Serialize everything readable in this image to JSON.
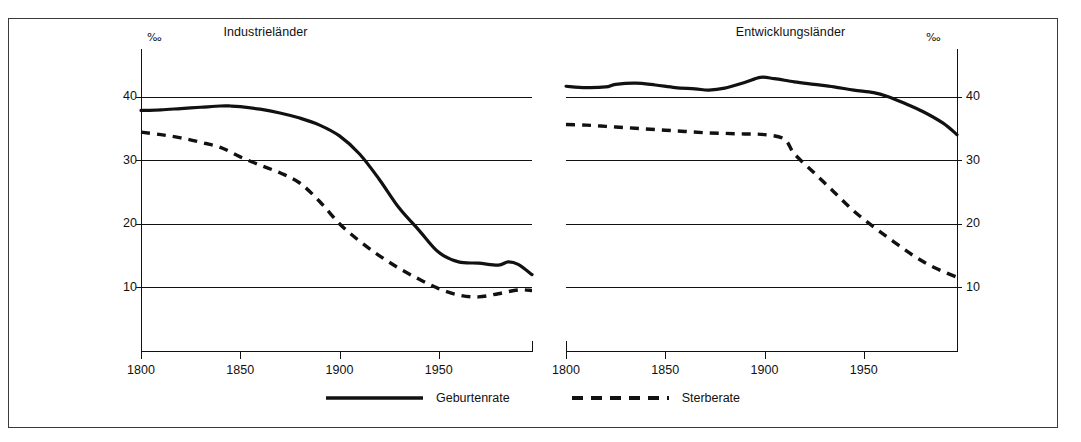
{
  "chart_data": [
    {
      "type": "line",
      "title": "Industrieländer",
      "xlabel": "",
      "ylabel": "‰",
      "xlim": [
        1800,
        1997
      ],
      "ylim": [
        0,
        44
      ],
      "xticks": [
        1800,
        1850,
        1900,
        1950
      ],
      "yticks": [
        10,
        20,
        30,
        40
      ],
      "grid": true,
      "legend_position": "bottom-center",
      "series": [
        {
          "name": "Geburtenrate",
          "style": "solid",
          "x": [
            1800,
            1810,
            1820,
            1830,
            1840,
            1845,
            1850,
            1860,
            1870,
            1880,
            1890,
            1900,
            1910,
            1920,
            1930,
            1940,
            1950,
            1960,
            1970,
            1980,
            1985,
            1990,
            1997
          ],
          "values": [
            37.8,
            37.9,
            38.1,
            38.3,
            38.5,
            38.5,
            38.4,
            38.0,
            37.4,
            36.6,
            35.5,
            33.8,
            31.0,
            27.0,
            22.5,
            19.0,
            15.5,
            14.0,
            13.8,
            13.5,
            14.0,
            13.6,
            12.0
          ]
        },
        {
          "name": "Sterberate",
          "style": "dashed",
          "x": [
            1800,
            1810,
            1820,
            1830,
            1840,
            1850,
            1860,
            1870,
            1880,
            1890,
            1900,
            1910,
            1920,
            1930,
            1940,
            1950,
            1960,
            1970,
            1980,
            1990,
            1997
          ],
          "values": [
            34.4,
            34.0,
            33.5,
            32.8,
            32.0,
            30.5,
            29.2,
            28.0,
            26.4,
            23.5,
            20.0,
            17.3,
            15.0,
            13.0,
            11.3,
            9.8,
            8.8,
            8.5,
            9.0,
            9.6,
            9.5
          ]
        }
      ]
    },
    {
      "type": "line",
      "title": "Entwicklungsländer",
      "xlabel": "",
      "ylabel": "‰",
      "xlim": [
        1800,
        1997
      ],
      "ylim": [
        0,
        44
      ],
      "xticks": [
        1800,
        1850,
        1900,
        1950
      ],
      "yticks": [
        10,
        20,
        30,
        40
      ],
      "grid": true,
      "legend_position": "bottom-center",
      "series": [
        {
          "name": "Geburtenrate",
          "style": "solid",
          "x": [
            1800,
            1810,
            1820,
            1825,
            1835,
            1845,
            1855,
            1865,
            1872,
            1880,
            1890,
            1898,
            1905,
            1915,
            1925,
            1935,
            1945,
            1955,
            1962,
            1970,
            1980,
            1990,
            1997
          ],
          "values": [
            41.6,
            41.4,
            41.5,
            41.9,
            42.1,
            41.8,
            41.4,
            41.2,
            41.0,
            41.3,
            42.2,
            43.0,
            42.8,
            42.3,
            41.9,
            41.5,
            41.0,
            40.6,
            40.0,
            39.0,
            37.6,
            35.8,
            34.0
          ]
        },
        {
          "name": "Sterberate",
          "style": "dashed",
          "x": [
            1800,
            1810,
            1820,
            1830,
            1840,
            1850,
            1860,
            1870,
            1880,
            1890,
            1900,
            1910,
            1915,
            1925,
            1935,
            1945,
            1955,
            1965,
            1975,
            1985,
            1997
          ],
          "values": [
            35.6,
            35.5,
            35.3,
            35.1,
            34.9,
            34.7,
            34.5,
            34.3,
            34.2,
            34.1,
            34.0,
            33.3,
            31.0,
            28.0,
            25.0,
            22.0,
            19.5,
            17.2,
            15.0,
            13.2,
            11.6
          ]
        }
      ]
    }
  ],
  "panels": [
    {
      "title": "Industrieländer",
      "permille": "‰",
      "yticks": [
        "40",
        "30",
        "20",
        "10"
      ],
      "xticks": [
        "1800",
        "1850",
        "1900",
        "1950"
      ]
    },
    {
      "title": "Entwicklungsländer",
      "permille": "‰",
      "yticks": [
        "40",
        "30",
        "20",
        "10"
      ],
      "xticks": [
        "1800",
        "1850",
        "1900",
        "1950"
      ]
    }
  ],
  "legend": {
    "items": [
      {
        "label": "Geburtenrate",
        "style": "solid"
      },
      {
        "label": "Sterberate",
        "style": "dashed"
      }
    ]
  },
  "colors": {
    "line": "#111111",
    "grid": "#111111",
    "border": "#3a3a3a",
    "background": "#ffffff"
  }
}
